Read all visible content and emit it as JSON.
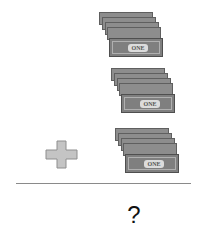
{
  "problem": {
    "stacks": [
      {
        "bill_count": 5,
        "bill_label": "ONE"
      },
      {
        "bill_count": 5,
        "bill_label": "ONE"
      },
      {
        "bill_count": 5,
        "bill_label": "ONE"
      }
    ],
    "operator": "plus-icon",
    "answer": "?"
  }
}
